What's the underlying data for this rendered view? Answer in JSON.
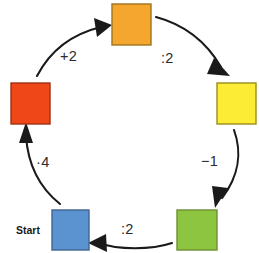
{
  "diagram": {
    "type": "cycle",
    "background_color": "#ffffff",
    "canvas": {
      "width": 259,
      "height": 253
    },
    "start_marker": {
      "label": "Start",
      "attached_to": "blue-square",
      "position": {
        "x": 16,
        "y": 224
      }
    },
    "nodes": [
      {
        "id": "orange-square",
        "color_name": "orange",
        "fill": "#F5A62E",
        "stroke": "#A0741D",
        "x": 112,
        "y": 4,
        "width": 39,
        "height": 41
      },
      {
        "id": "yellow-square",
        "color_name": "yellow",
        "fill": "#FCEC36",
        "stroke": "#9A8E1C",
        "x": 217,
        "y": 83,
        "width": 39,
        "height": 41
      },
      {
        "id": "green-square",
        "color_name": "green",
        "fill": "#8DC541",
        "stroke": "#6E8F33",
        "x": 177,
        "y": 210,
        "width": 40,
        "height": 40
      },
      {
        "id": "blue-square",
        "color_name": "blue",
        "fill": "#5B92D0",
        "stroke": "#41648E",
        "x": 52,
        "y": 210,
        "width": 37,
        "height": 40
      },
      {
        "id": "red-square",
        "color_name": "red",
        "fill": "#F04718",
        "stroke": "#9C3314",
        "x": 11,
        "y": 83,
        "width": 39,
        "height": 41
      }
    ],
    "edges": [
      {
        "id": "edge-orange-to-yellow",
        "from": "orange-square",
        "to": "yellow-square",
        "label": ":2",
        "label_position": {
          "x": 161,
          "y": 50
        },
        "path": "M 156 17 C 186 25 207 43 221 67",
        "head": "214,58 230,76 207,74"
      },
      {
        "id": "edge-yellow-to-green",
        "from": "yellow-square",
        "to": "green-square",
        "label": "−1",
        "label_position": {
          "x": 201,
          "y": 153
        },
        "path": "M 234 130 C 242 152 239 176 222 198",
        "head": "228,188 215,208 212,186"
      },
      {
        "id": "edge-green-to-blue",
        "from": "green-square",
        "to": "blue-square",
        "label": ":2",
        "label_position": {
          "x": 121,
          "y": 221
        },
        "path": "M 172 243 C 151 250 118 250 99 243",
        "head": "106,234 88,243 107,252"
      },
      {
        "id": "edge-blue-to-red",
        "from": "blue-square",
        "to": "red-square",
        "label": "·4",
        "label_position": {
          "x": 36,
          "y": 154
        },
        "path": "M 60 204 C 40 188 28 166 26 136",
        "head": "19,143 26,122 33,143"
      },
      {
        "id": "edge-red-to-orange",
        "from": "red-square",
        "to": "orange-square",
        "label": "+2",
        "label_position": {
          "x": 60,
          "y": 48
        },
        "path": "M 37 76 C 50 51 72 34 101 27",
        "head": "94,18 112,25 97,37"
      }
    ]
  }
}
